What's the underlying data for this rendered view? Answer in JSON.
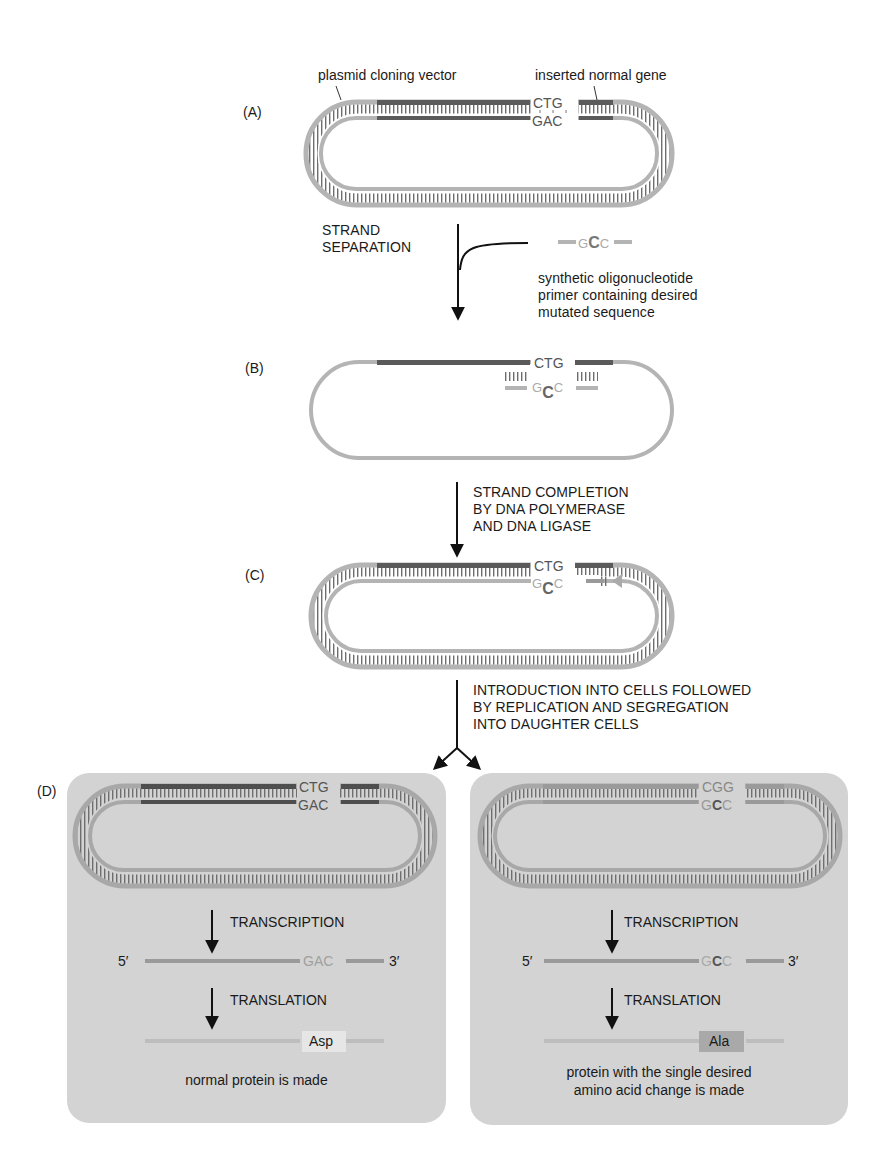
{
  "figure": {
    "panel_labels": {
      "a": "(A)",
      "b": "(B)",
      "c": "(C)",
      "d": "(D)"
    },
    "callouts": {
      "vector": "plasmid cloning vector",
      "gene": "inserted normal gene",
      "primer": [
        "synthetic oligonucleotide",
        "primer containing desired",
        "mutated sequence"
      ]
    },
    "steps": {
      "separation": [
        "STRAND",
        "SEPARATION"
      ],
      "completion": [
        "STRAND COMPLETION",
        "BY DNA POLYMERASE",
        "AND DNA LIGASE"
      ],
      "introduction": [
        "INTRODUCTION INTO CELLS FOLLOWED",
        "BY REPLICATION AND SEGREGATION",
        "INTO DAUGHTER CELLS"
      ]
    },
    "sequences": {
      "normal_top": "CTG",
      "normal_bottom": "GAC",
      "mutant_top": "CGG",
      "primer": [
        "G",
        "C",
        "C"
      ]
    },
    "outcomes": {
      "normal": {
        "transcription": "TRANSCRIPTION",
        "translation": "TRANSLATION",
        "five_prime": "5′",
        "three_prime": "3′",
        "codon": "GAC",
        "amino_acid": "Asp",
        "caption": "normal protein is made"
      },
      "mutant": {
        "transcription": "TRANSCRIPTION",
        "translation": "TRANSLATION",
        "five_prime": "5′",
        "three_prime": "3′",
        "codon": [
          "G",
          "C",
          "C"
        ],
        "amino_acid": "Ala",
        "caption": [
          "protein with the single desired",
          "amino acid change is made"
        ]
      }
    },
    "colors": {
      "vector_strand": "#b4b4b4",
      "gene_strand": "#5a5a5a",
      "mutant_strand": "#9a9a9a",
      "panel_bg": "#d3d3d3",
      "rung": "#6e6e6e",
      "arrow": "#111111"
    }
  }
}
